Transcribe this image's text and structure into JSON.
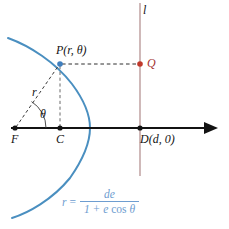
{
  "figure": {
    "colors": {
      "curve": "#4a8fc0",
      "axis": "#131313",
      "directrix": "#a87f7f",
      "point_red": "#c0392b",
      "point_blue": "#3f7fbf",
      "dashed": "#3a3a3a",
      "formula": "#6e9dd0",
      "background": "#ffffff"
    },
    "labels": {
      "directrix": "l",
      "point_p": "P(r, θ)",
      "point_q": "Q",
      "radius": "r",
      "angle": "θ",
      "focus": "F",
      "center": "C",
      "point_d": "D(d, 0)"
    },
    "formula": {
      "lhs": "r",
      "equals": "=",
      "numerator": "de",
      "denominator_pre": "1 + e ",
      "denominator_cos": "cos",
      "denominator_theta": " θ"
    },
    "geometry": {
      "focus_x": 15,
      "focus_y": 128,
      "center_x": 60,
      "center_y": 128,
      "vertex_x": 90,
      "directrix_x": 140,
      "point_p_x": 60,
      "point_p_y": 64,
      "point_q_x": 140,
      "point_q_y": 64,
      "point_d_x": 140,
      "point_d_y": 128,
      "axis_arrow_x": 216
    }
  }
}
